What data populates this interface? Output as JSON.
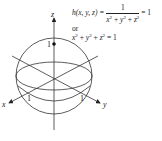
{
  "figure": {
    "type": "unit-sphere-level-surface",
    "axes": {
      "x_label": "x",
      "y_label": "y",
      "z_label": "z"
    },
    "tick_labels": {
      "x": "1",
      "y": "1",
      "z": "1"
    },
    "equation": {
      "lhs": "h(x, y, z) =",
      "numerator": "1",
      "denominator": "x² + y² + z²",
      "rhs": "= 1",
      "connector": "or",
      "alt": "x² + y² + z² = 1"
    },
    "colors": {
      "stroke": "#222222",
      "background": "#ffffff"
    }
  }
}
